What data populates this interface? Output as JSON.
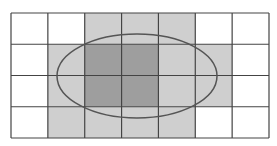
{
  "diagram": {
    "grid": {
      "cols": 7,
      "rows": 4,
      "x": 11,
      "y": 13,
      "width": 258,
      "height": 125
    },
    "cells": [
      [
        0,
        0,
        1,
        1,
        1,
        0,
        0
      ],
      [
        0,
        1,
        2,
        2,
        1,
        1,
        0
      ],
      [
        0,
        1,
        2,
        2,
        1,
        1,
        0
      ],
      [
        0,
        1,
        1,
        1,
        1,
        0,
        0
      ]
    ],
    "colors": {
      "0": "#ffffff",
      "1": "#cfcfcf",
      "2": "#9e9e9e",
      "line": "#444444",
      "ellipse": "#555555"
    },
    "ellipse": {
      "cx": 137,
      "cy": 76,
      "rx": 80,
      "ry": 42
    }
  }
}
